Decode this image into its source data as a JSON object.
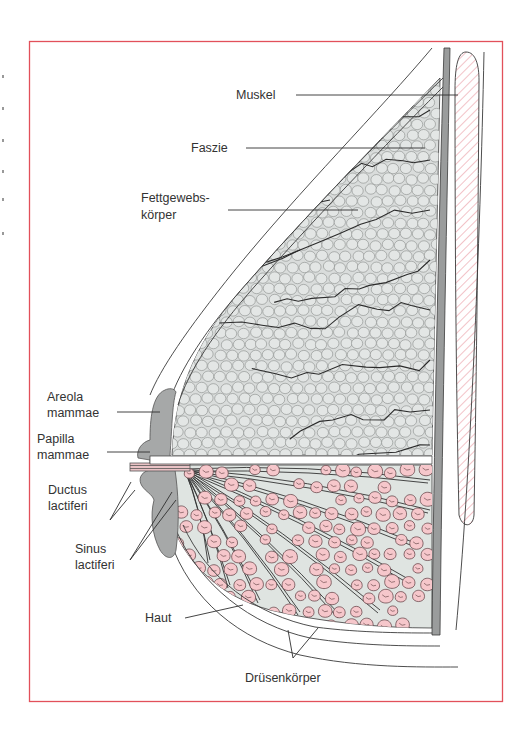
{
  "figure": {
    "colors": {
      "frame": "#e2505a",
      "outline": "#3a3a3a",
      "fat_fill": "#d9dcdb",
      "fat_lobule_line": "#8a8d8c",
      "septa": "#2b2b2b",
      "gland_bg": "#dfe4e1",
      "gland_lobule": "#f6c7cb",
      "areola": "#a6a8a8",
      "fascia_band": "#9a9c9c",
      "muscle_hatch": "#ea9aa2"
    },
    "labels": {
      "muskel": "Muskel",
      "faszie": "Faszie",
      "fettgewebs_1": "Fettgewebs-",
      "fettgewebs_2": "körper",
      "areola_1": "Areola",
      "areola_2": "mammae",
      "papilla_1": "Papilla",
      "papilla_2": "mammae",
      "ductus_1": "Ductus",
      "ductus_2": "lactiferi",
      "sinus_1": "Sinus",
      "sinus_2": "lactiferi",
      "haut": "Haut",
      "druesen": "Drüsenkörper"
    }
  }
}
